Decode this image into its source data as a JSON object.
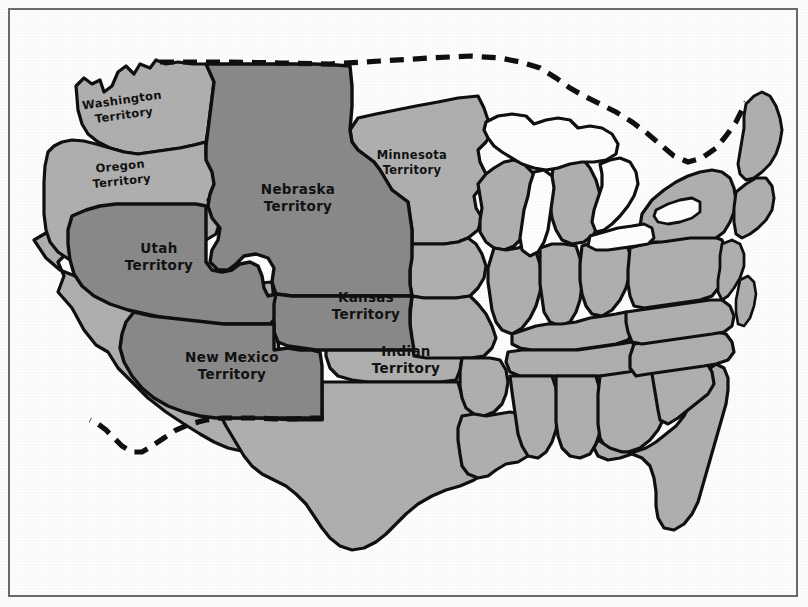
{
  "document": {
    "kind": "historical-map",
    "subject": "United States territories and states",
    "frame_color": "#6b6b6b",
    "background_color": "#fefefe"
  },
  "legend_colors": {
    "territory_dark": "#8a8a8a",
    "state_light": "#b0b0b0",
    "water_white": "#ffffff",
    "outline_black": "#101010",
    "international_border": "#101010"
  },
  "labels": [
    {
      "name": "washington-territory",
      "line1": "Washington",
      "line2": "Territory",
      "x": 123,
      "y": 108,
      "rotate": -8,
      "size": "small",
      "fill": "state_light"
    },
    {
      "name": "oregon-territory",
      "line1": "Oregon",
      "line2": "Territory",
      "x": 121,
      "y": 174,
      "rotate": -6,
      "size": "small",
      "fill": "state_light"
    },
    {
      "name": "nebraska-territory",
      "line1": "Nebraska",
      "line2": "Territory",
      "x": 298,
      "y": 198,
      "rotate": 0,
      "size": "normal",
      "fill": "territory_dark"
    },
    {
      "name": "minnesota-territory",
      "line1": "Minnesota",
      "line2": "Territory",
      "x": 412,
      "y": 163,
      "rotate": 0,
      "size": "small",
      "fill": "state_light"
    },
    {
      "name": "utah-territory",
      "line1": "Utah",
      "line2": "Territory",
      "x": 159,
      "y": 257,
      "rotate": 0,
      "size": "normal",
      "fill": "territory_dark"
    },
    {
      "name": "kansas-territory",
      "line1": "Kansas",
      "line2": "Territory",
      "x": 366,
      "y": 306,
      "rotate": 0,
      "size": "normal",
      "fill": "territory_dark"
    },
    {
      "name": "new-mexico-territory",
      "line1": "New Mexico",
      "line2": "Territory",
      "x": 232,
      "y": 366,
      "rotate": 0,
      "size": "normal",
      "fill": "territory_dark"
    },
    {
      "name": "indian-territory",
      "line1": "Indian",
      "line2": "Territory",
      "x": 406,
      "y": 360,
      "rotate": 0,
      "size": "normal",
      "fill": "state_light"
    }
  ],
  "regions": {
    "territories_dark": [
      "Nebraska Territory",
      "Utah Territory",
      "Kansas Territory",
      "New Mexico Territory"
    ],
    "territories_light": [
      "Washington Territory",
      "Oregon Territory",
      "Minnesota Territory",
      "Indian Territory"
    ],
    "water_bodies": [
      "Great Lakes",
      "Atlantic Ocean",
      "Gulf of Mexico",
      "Pacific Ocean"
    ]
  }
}
